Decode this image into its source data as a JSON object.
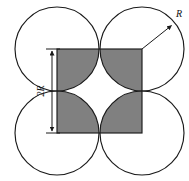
{
  "figure": {
    "background_color": "#ffffff",
    "line_color": "#1a1a1a",
    "square_fill_color": "#808080",
    "center_region_color": "#ffffff",
    "labels": {
      "radius_label": "R",
      "side_label": "2R"
    },
    "geometry": {
      "square": {
        "x": 57,
        "y": 49,
        "width": 85,
        "height": 84,
        "corners": [
          [
            57,
            49
          ],
          [
            142,
            49
          ],
          [
            57,
            133
          ],
          [
            142,
            133
          ]
        ]
      },
      "circles": [
        {
          "name": "top-left-circle",
          "cx": 57,
          "cy": 49,
          "r": 42
        },
        {
          "name": "top-right-circle",
          "cx": 142,
          "cy": 49,
          "r": 42
        },
        {
          "name": "bottom-left-circle",
          "cx": 57,
          "cy": 133,
          "r": 42
        },
        {
          "name": "bottom-right-circle",
          "cx": 142,
          "cy": 133,
          "r": 42
        }
      ],
      "radius_arrow": {
        "from": [
          142,
          49
        ],
        "to": [
          173,
          24
        ]
      },
      "dimension_line": {
        "x": 52,
        "y_top": 49,
        "y_bottom": 133
      }
    }
  }
}
